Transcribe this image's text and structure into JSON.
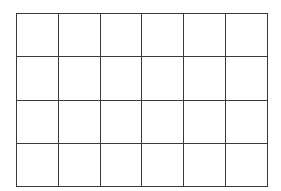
{
  "grid": {
    "rows": 4,
    "columns": 6,
    "line_color": "#3a3a3a",
    "background_color": "#ffffff",
    "cells": [
      [
        "",
        "",
        "",
        "",
        "",
        ""
      ],
      [
        "",
        "",
        "",
        "",
        "",
        ""
      ],
      [
        "",
        "",
        "",
        "",
        "",
        ""
      ],
      [
        "",
        "",
        "",
        "",
        "",
        ""
      ]
    ]
  }
}
